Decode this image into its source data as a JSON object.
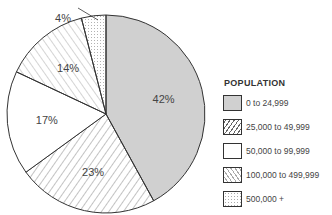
{
  "chart_data": {
    "type": "pie",
    "title": "",
    "legend_title": "POPULATION",
    "legend_position": "right",
    "categories": [
      "0 to 24,999",
      "25,000 to 49,999",
      "50,000 to 99,999",
      "100,000 to 499,999",
      "500,000 +"
    ],
    "values": [
      42,
      23,
      17,
      14,
      4
    ],
    "value_labels": [
      "42%",
      "23%",
      "17%",
      "14%",
      "4%"
    ],
    "unit": "%",
    "fills": [
      "solid-gray",
      "diagonal-hatch-forward",
      "white",
      "diagonal-hatch-backward",
      "dotted"
    ],
    "start_angle": "12 o'clock",
    "direction": "clockwise"
  },
  "colors": {
    "gray_fill": "#d0d0d0",
    "outline": "#333333",
    "hatch": "#999999"
  }
}
